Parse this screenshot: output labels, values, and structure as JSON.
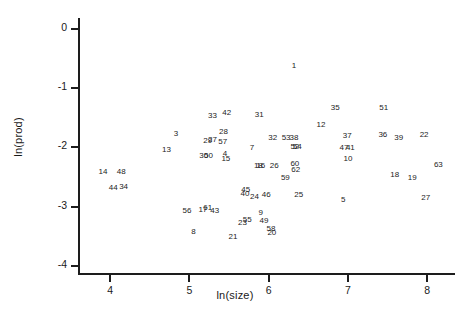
{
  "chart_data": {
    "type": "scatter",
    "title": "",
    "xlabel": "ln(size)",
    "ylabel": "ln(prod)",
    "xlim": [
      3.62,
      8.35
    ],
    "ylim": [
      -4.12,
      0.18
    ],
    "xticks": [
      4,
      5,
      6,
      7,
      8
    ],
    "xticklabels": [
      "4",
      "5",
      "6",
      "7",
      "8"
    ],
    "yticks": [
      0,
      -1,
      -2,
      -3,
      -4
    ],
    "yticklabels": [
      "0",
      "-1",
      "-2",
      "-3",
      "-4"
    ],
    "grid": false,
    "legend": null,
    "marker_style": "numeric-label",
    "note": "Each observation is plotted as its case-number label rather than a marker symbol.",
    "points": [
      {
        "label": "1",
        "x": 6.32,
        "y": -0.63
      },
      {
        "label": "35",
        "x": 6.84,
        "y": -1.34
      },
      {
        "label": "51",
        "x": 7.45,
        "y": -1.33
      },
      {
        "label": "33",
        "x": 5.29,
        "y": -1.47
      },
      {
        "label": "42",
        "x": 5.47,
        "y": -1.42
      },
      {
        "label": "31",
        "x": 5.88,
        "y": -1.46
      },
      {
        "label": "12",
        "x": 6.66,
        "y": -1.62
      },
      {
        "label": "3",
        "x": 4.83,
        "y": -1.77
      },
      {
        "label": "28",
        "x": 5.43,
        "y": -1.75
      },
      {
        "label": "32",
        "x": 6.05,
        "y": -1.84
      },
      {
        "label": "53",
        "x": 6.22,
        "y": -1.85
      },
      {
        "label": "38",
        "x": 6.32,
        "y": -1.85
      },
      {
        "label": "37",
        "x": 6.99,
        "y": -1.81
      },
      {
        "label": "36",
        "x": 7.44,
        "y": -1.79
      },
      {
        "label": "39",
        "x": 7.64,
        "y": -1.85
      },
      {
        "label": "22",
        "x": 7.96,
        "y": -1.8
      },
      {
        "label": "29",
        "x": 5.23,
        "y": -1.9
      },
      {
        "label": "27",
        "x": 5.29,
        "y": -1.88
      },
      {
        "label": "57",
        "x": 5.42,
        "y": -1.91
      },
      {
        "label": "52",
        "x": 6.33,
        "y": -1.99
      },
      {
        "label": "54",
        "x": 6.36,
        "y": -2.0
      },
      {
        "label": "13",
        "x": 4.71,
        "y": -2.04
      },
      {
        "label": "7",
        "x": 5.79,
        "y": -2.02
      },
      {
        "label": "47",
        "x": 6.95,
        "y": -2.02
      },
      {
        "label": "41",
        "x": 7.03,
        "y": -2.02
      },
      {
        "label": "30",
        "x": 5.18,
        "y": -2.14
      },
      {
        "label": "50",
        "x": 5.24,
        "y": -2.14
      },
      {
        "label": "4",
        "x": 5.45,
        "y": -2.12
      },
      {
        "label": "15",
        "x": 5.46,
        "y": -2.2
      },
      {
        "label": "10",
        "x": 7.0,
        "y": -2.2
      },
      {
        "label": "63",
        "x": 8.14,
        "y": -2.3
      },
      {
        "label": "18",
        "x": 5.87,
        "y": -2.31
      },
      {
        "label": "16",
        "x": 5.9,
        "y": -2.31
      },
      {
        "label": "26",
        "x": 6.07,
        "y": -2.31
      },
      {
        "label": "60",
        "x": 6.33,
        "y": -2.29
      },
      {
        "label": "62",
        "x": 6.34,
        "y": -2.38
      },
      {
        "label": "14",
        "x": 3.91,
        "y": -2.41
      },
      {
        "label": "48",
        "x": 4.14,
        "y": -2.41
      },
      {
        "label": "18",
        "x": 7.59,
        "y": -2.47
      },
      {
        "label": "19",
        "x": 7.81,
        "y": -2.52
      },
      {
        "label": "59",
        "x": 6.21,
        "y": -2.52
      },
      {
        "label": "44",
        "x": 4.04,
        "y": -2.69
      },
      {
        "label": "34",
        "x": 4.17,
        "y": -2.67
      },
      {
        "label": "45",
        "x": 5.71,
        "y": -2.72
      },
      {
        "label": "40",
        "x": 5.7,
        "y": -2.78
      },
      {
        "label": "24",
        "x": 5.82,
        "y": -2.83
      },
      {
        "label": "46",
        "x": 5.97,
        "y": -2.81
      },
      {
        "label": "25",
        "x": 6.38,
        "y": -2.8
      },
      {
        "label": "27",
        "x": 7.98,
        "y": -2.86
      },
      {
        "label": "5",
        "x": 6.94,
        "y": -2.89
      },
      {
        "label": "56",
        "x": 4.97,
        "y": -3.08
      },
      {
        "label": "17",
        "x": 5.17,
        "y": -3.06
      },
      {
        "label": "61",
        "x": 5.23,
        "y": -3.03
      },
      {
        "label": "43",
        "x": 5.32,
        "y": -3.08
      },
      {
        "label": "9",
        "x": 5.9,
        "y": -3.11
      },
      {
        "label": "55",
        "x": 5.73,
        "y": -3.22
      },
      {
        "label": "49",
        "x": 5.94,
        "y": -3.24
      },
      {
        "label": "23",
        "x": 5.67,
        "y": -3.28
      },
      {
        "label": "8",
        "x": 5.05,
        "y": -3.43
      },
      {
        "label": "58",
        "x": 6.03,
        "y": -3.38
      },
      {
        "label": "20",
        "x": 6.04,
        "y": -3.44
      },
      {
        "label": "21",
        "x": 5.55,
        "y": -3.52
      }
    ]
  }
}
